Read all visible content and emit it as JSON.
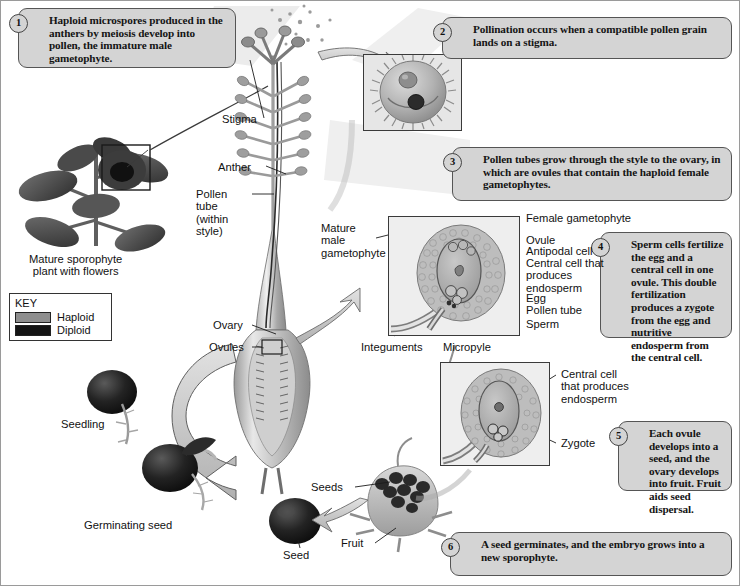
{
  "figure": {
    "background": "#ffffff",
    "callout_fill": "#d4d4d4",
    "haploid_color": "#8e8e8e",
    "diploid_color": "#141414"
  },
  "callouts": [
    {
      "num": "1",
      "text": "Haploid microspores produced in the anthers by meiosis develop into pollen, the immature male gametophyte."
    },
    {
      "num": "2",
      "text": "Pollination occurs when a compatible pollen grain lands on a stigma."
    },
    {
      "num": "3",
      "text": "Pollen tubes grow through the style to the ovary, in which are ovules that contain the haploid female gametophytes."
    },
    {
      "num": "4",
      "text": "Sperm cells fertilize the egg and a central cell in one ovule. This double fertilization produces a zygote from the egg and nutritive endosperm from the central cell."
    },
    {
      "num": "5",
      "text": "Each ovule develops into a seed, and the ovary develops into fruit. Fruit aids seed dispersal."
    },
    {
      "num": "6",
      "text": "A seed germinates, and the embryo grows into a new sporophyte."
    }
  ],
  "key": {
    "title": "KEY",
    "items": [
      {
        "label": "Haploid",
        "color": "#8e8e8e"
      },
      {
        "label": "Diploid",
        "color": "#141414"
      }
    ]
  },
  "labels": {
    "mature_sporophyte": "Mature sporophyte\nplant with flowers",
    "stigma": "Stigma",
    "anther": "Anther",
    "pollen_tube_style": "Pollen\ntube\n(within\nstyle)",
    "ovary": "Ovary",
    "ovules": "Ovules",
    "mature_male_gametophyte": "Mature\nmale\ngametophyte",
    "female_gametophyte": "Female gametophyte",
    "ovule": "Ovule",
    "antipodal_cell": "Antipodal cell",
    "central_cell_endosperm": "Central cell that\nproduces\nendosperm",
    "egg": "Egg",
    "pollen_tube": "Pollen tube",
    "sperm": "Sperm",
    "integuments": "Integuments",
    "micropyle": "Micropyle",
    "central_cell_endosperm_2": "Central cell\nthat produces\nendosperm",
    "zygote": "Zygote",
    "seeds": "Seeds",
    "fruit": "Fruit",
    "seed": "Seed",
    "seedling": "Seedling",
    "germinating_seed": "Germinating seed"
  },
  "insets": [
    {
      "name": "pollen-grain-inset"
    },
    {
      "name": "ovule-female-gametophyte-inset"
    },
    {
      "name": "zygote-endosperm-inset"
    }
  ]
}
